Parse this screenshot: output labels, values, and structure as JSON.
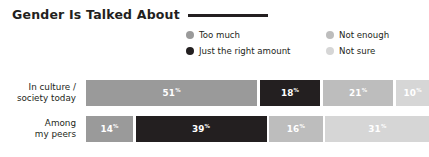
{
  "header": {
    "title": "Gender Is Talked About",
    "rule": true
  },
  "legend": {
    "items": [
      {
        "label": "Too much",
        "color": "#9a9a9a",
        "swatch_name": "legend-swatch-too-much"
      },
      {
        "label": "Not enough",
        "color": "#bdbdbd",
        "swatch_name": "legend-swatch-not-enough"
      },
      {
        "label": "Just the right amount",
        "color": "#231f20",
        "swatch_name": "legend-swatch-just-right"
      },
      {
        "label": "Not sure",
        "color": "#d6d6d6",
        "swatch_name": "legend-swatch-not-sure"
      }
    ]
  },
  "chart_data": {
    "type": "bar",
    "title": "Gender Is Talked About",
    "xlabel": "",
    "ylabel": "",
    "orientation": "horizontal",
    "stacked": true,
    "grid": false,
    "legend_position": "top-right",
    "value_suffix": "%",
    "xlim": [
      0,
      100
    ],
    "categories": [
      "In culture / society today",
      "Among my peers"
    ],
    "category_lines": [
      [
        "In culture /",
        "society today"
      ],
      [
        "Among",
        "my peers"
      ]
    ],
    "series": [
      {
        "name": "Too much",
        "color": "#9a9a9a",
        "values": [
          51,
          14
        ]
      },
      {
        "name": "Just the right amount",
        "color": "#231f20",
        "values": [
          18,
          39
        ]
      },
      {
        "name": "Not enough",
        "color": "#bdbdbd",
        "values": [
          21,
          16
        ]
      },
      {
        "name": "Not sure",
        "color": "#d6d6d6",
        "values": [
          10,
          31
        ]
      }
    ],
    "rows": [
      {
        "label_line1": "In culture /",
        "label_line2": "society today",
        "segments": [
          {
            "series": "Too much",
            "value": "51",
            "suffix": "%",
            "color": "#9a9a9a"
          },
          {
            "series": "Just the right amount",
            "value": "18",
            "suffix": "%",
            "color": "#231f20"
          },
          {
            "series": "Not enough",
            "value": "21",
            "suffix": "%",
            "color": "#bdbdbd"
          },
          {
            "series": "Not sure",
            "value": "10",
            "suffix": "%",
            "color": "#d6d6d6"
          }
        ]
      },
      {
        "label_line1": "Among",
        "label_line2": "my peers",
        "segments": [
          {
            "series": "Too much",
            "value": "14",
            "suffix": "%",
            "color": "#9a9a9a"
          },
          {
            "series": "Just the right amount",
            "value": "39",
            "suffix": "%",
            "color": "#231f20"
          },
          {
            "series": "Not enough",
            "value": "16",
            "suffix": "%",
            "color": "#bdbdbd"
          },
          {
            "series": "Not sure",
            "value": "31",
            "suffix": "%",
            "color": "#d6d6d6"
          }
        ]
      }
    ]
  },
  "colors": {
    "text": "#231f20",
    "background": "#ffffff",
    "value_text": "#ffffff"
  }
}
